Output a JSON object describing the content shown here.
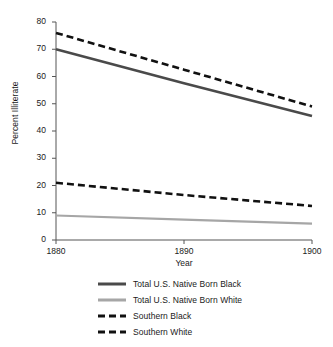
{
  "chart_data": {
    "type": "line",
    "title": "",
    "xlabel": "Year",
    "ylabel": "Percent Illiterate",
    "x": [
      1880,
      1890,
      1900
    ],
    "xlim": [
      1880,
      1900
    ],
    "ylim": [
      0,
      80
    ],
    "xticks": [
      "1880",
      "1890",
      "1900"
    ],
    "yticks": [
      "0",
      "10",
      "20",
      "30",
      "40",
      "50",
      "60",
      "70",
      "80"
    ],
    "grid": false,
    "legend_position": "bottom",
    "series": [
      {
        "name": "Total U.S. Native Born Black",
        "values": [
          70,
          57.5,
          45.5
        ],
        "color": "#4a4a4a",
        "style": "solid",
        "width": 2.6
      },
      {
        "name": "Total U.S. Native Born White",
        "values": [
          9,
          7.5,
          6
        ],
        "color": "#a6a6a6",
        "style": "solid",
        "width": 2.2
      },
      {
        "name": "Southern Black",
        "values": [
          76,
          62.5,
          49
        ],
        "color": "#111111",
        "style": "dashed",
        "width": 2.6
      },
      {
        "name": "Southern White",
        "values": [
          21,
          16.5,
          12.5
        ],
        "color": "#111111",
        "style": "dashed",
        "width": 2.6
      }
    ]
  },
  "legend": {
    "items": [
      {
        "label": "Total U.S. Native Born Black",
        "color": "#4a4a4a",
        "style": "solid"
      },
      {
        "label": "Total U.S. Native Born White",
        "color": "#a6a6a6",
        "style": "solid"
      },
      {
        "label": "Southern Black",
        "color": "#111111",
        "style": "dashed"
      },
      {
        "label": "Southern White",
        "color": "#111111",
        "style": "dashed"
      }
    ]
  },
  "axes": {
    "axis_color": "#555555"
  }
}
